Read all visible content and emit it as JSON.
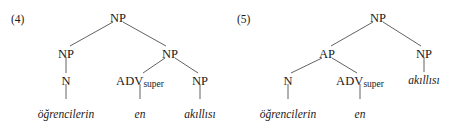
{
  "figure": {
    "background_color": "#ffffff",
    "text_color": "#1a1a1a",
    "line_color": "#3a3a3a",
    "caption": "Two syntactic tree diagrams for Turkish superlative noun phrases"
  },
  "trees": [
    {
      "id": "tree-4",
      "number_label": "(4)",
      "nodes": {
        "root": "NP",
        "left_branch": "NP",
        "right_branch": "NP",
        "left_head": "N",
        "adv_main": "ADV",
        "adv_sub": "super",
        "right_inner": "NP"
      },
      "terminals": {
        "first": "öğrencilerin",
        "second": "en",
        "third": "akıllısı"
      }
    },
    {
      "id": "tree-5",
      "number_label": "(5)",
      "nodes": {
        "root": "NP",
        "left_branch": "AP",
        "right_branch": "NP",
        "left_head": "N",
        "adv_main": "ADV",
        "adv_sub": "super"
      },
      "terminals": {
        "first": "öğrencilerin",
        "second": "en",
        "third": "akıllısı"
      }
    }
  ]
}
